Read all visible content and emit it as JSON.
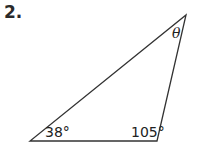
{
  "problem": {
    "number": "2."
  },
  "triangle": {
    "vertices": {
      "bottom_left": [
        30,
        141
      ],
      "bottom_right": [
        157,
        141
      ],
      "top": [
        186,
        15
      ]
    },
    "angles": {
      "bottom_left": "38°",
      "bottom_right": "105°",
      "top": "θ"
    },
    "stroke_color": "#333333"
  }
}
